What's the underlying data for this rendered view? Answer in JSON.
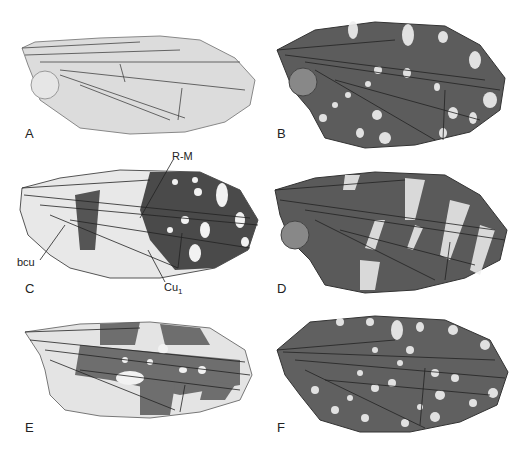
{
  "figure": {
    "panels": [
      {
        "id": "A",
        "label": "A",
        "pattern": "clear"
      },
      {
        "id": "B",
        "label": "B",
        "pattern": "dark-spotted"
      },
      {
        "id": "C",
        "label": "C",
        "pattern": "banded-spotted"
      },
      {
        "id": "D",
        "label": "D",
        "pattern": "dark-banded"
      },
      {
        "id": "E",
        "label": "E",
        "pattern": "light-banded"
      },
      {
        "id": "F",
        "label": "F",
        "pattern": "dark-fine-spotted"
      }
    ],
    "annotations": {
      "rm": "R-M",
      "bcu": "bcu",
      "cu1_base": "Cu",
      "cu1_sub": "1"
    },
    "colors": {
      "clear_membrane": "#e0e0e0",
      "dark_membrane": "#5a5a5a",
      "spot": "#f2f2f2",
      "vein": "#2a2a2a"
    }
  }
}
